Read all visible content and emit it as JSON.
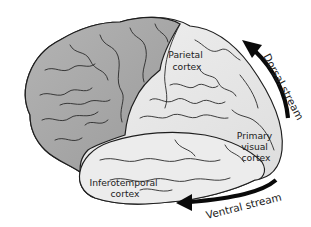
{
  "diagram": {
    "colors": {
      "frontal_fill": "#a4a4a4",
      "posterior_fill": "#e6e6e6",
      "temporal_fill": "#ececec",
      "outline": "#1e1e1e",
      "arrow": "#0a0a0a",
      "text": "#222222",
      "background": "#ffffff"
    },
    "regions": [
      {
        "id": "parietal",
        "label_lines": [
          "Parietal",
          "cortex"
        ]
      },
      {
        "id": "primary-visual",
        "label_lines": [
          "Primary",
          "visual",
          "cortex"
        ]
      },
      {
        "id": "inferotemporal",
        "label_lines": [
          "Inferotemporal",
          "cortex"
        ]
      }
    ],
    "streams": [
      {
        "id": "dorsal",
        "label": "Dorsal stream",
        "direction": "upward along the back of the brain toward the parietal cortex"
      },
      {
        "id": "ventral",
        "label": "Ventral stream",
        "direction": "forward along the bottom toward the inferotemporal cortex"
      }
    ]
  }
}
